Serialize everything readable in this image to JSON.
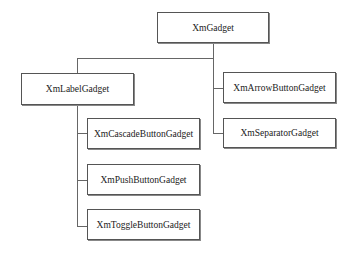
{
  "diagram": {
    "title": "",
    "nodes": [
      {
        "id": "root",
        "label": "XmGadget"
      },
      {
        "id": "label",
        "label": "XmLabelGadget",
        "parent": "root"
      },
      {
        "id": "arrow",
        "label": "XmArrowButtonGadget",
        "parent": "root"
      },
      {
        "id": "separator",
        "label": "XmSeparatorGadget",
        "parent": "root"
      },
      {
        "id": "cascade",
        "label": "XmCascadeButtonGadget",
        "parent": "label"
      },
      {
        "id": "push",
        "label": "XmPushButtonGadget",
        "parent": "label"
      },
      {
        "id": "toggle",
        "label": "XmToggleButtonGadget",
        "parent": "label"
      }
    ]
  },
  "colors": {
    "line": "#666666",
    "border": "#555555",
    "background": "#ffffff"
  }
}
